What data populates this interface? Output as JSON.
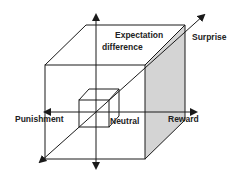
{
  "diagram": {
    "type": "3d-cube-axes",
    "labels": {
      "expectation": "Expectation",
      "difference": "difference",
      "surprise": "Surprise",
      "punishment": "Punishment",
      "neutral": "Neutral",
      "reward": "Reward"
    },
    "colors": {
      "stroke": "#1a1a1a",
      "shaded_face": "#d4d4d4",
      "background": "#ffffff"
    }
  }
}
